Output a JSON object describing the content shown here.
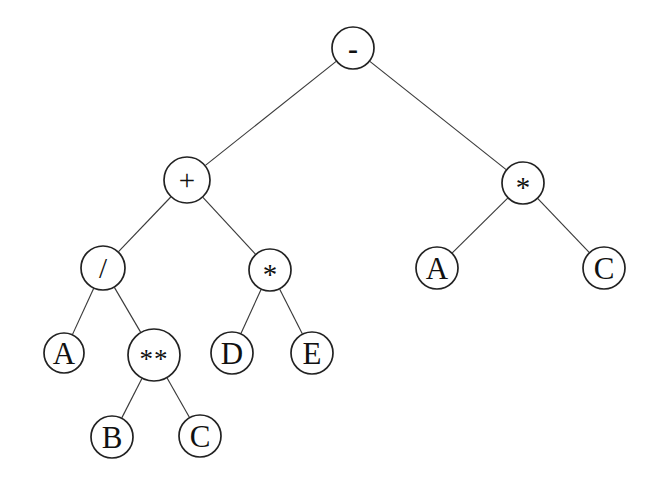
{
  "figure": {
    "kind": "binary-expression-tree",
    "title": "",
    "background_color": "#ffffff",
    "node_fill_color": "#ffffff",
    "node_stroke_color": "#222222",
    "edge_color": "#3a3a3a",
    "label_color": "#111111",
    "expression": "A / B ** C + D * E - A * C"
  },
  "nodes": [
    {
      "id": "n0",
      "label": "-",
      "role": "operator",
      "style": "minus",
      "cx": 353,
      "cy": 48,
      "r": 21
    },
    {
      "id": "n1",
      "label": "+",
      "role": "operator",
      "style": "operator",
      "cx": 187,
      "cy": 180,
      "r": 23
    },
    {
      "id": "n2",
      "label": "*",
      "role": "operator",
      "style": "operator",
      "cx": 523,
      "cy": 183,
      "r": 21
    },
    {
      "id": "n3",
      "label": "/",
      "role": "operator",
      "style": "operator",
      "cx": 103,
      "cy": 268,
      "r": 22
    },
    {
      "id": "n4",
      "label": "*",
      "role": "operator",
      "style": "operator",
      "cx": 270,
      "cy": 270,
      "r": 21
    },
    {
      "id": "n5",
      "label": "A",
      "role": "operand",
      "style": "operand",
      "cx": 437,
      "cy": 268,
      "r": 21
    },
    {
      "id": "n6",
      "label": "C",
      "role": "operand",
      "style": "operand",
      "cx": 604,
      "cy": 268,
      "r": 21
    },
    {
      "id": "n7",
      "label": "A",
      "role": "operand",
      "style": "operand",
      "cx": 64,
      "cy": 353,
      "r": 20
    },
    {
      "id": "n8",
      "label": "**",
      "role": "operator",
      "style": "power",
      "cx": 154,
      "cy": 355,
      "r": 26
    },
    {
      "id": "n9",
      "label": "D",
      "role": "operand",
      "style": "operand",
      "cx": 232,
      "cy": 353,
      "r": 21
    },
    {
      "id": "n10",
      "label": "E",
      "role": "operand",
      "style": "operand",
      "cx": 312,
      "cy": 353,
      "r": 21
    },
    {
      "id": "n11",
      "label": "B",
      "role": "operand",
      "style": "operand",
      "cx": 112,
      "cy": 437,
      "r": 21
    },
    {
      "id": "n12",
      "label": "C",
      "role": "operand",
      "style": "operand",
      "cx": 200,
      "cy": 436,
      "r": 21
    }
  ],
  "edges": [
    {
      "from": "n0",
      "to": "n1"
    },
    {
      "from": "n0",
      "to": "n2"
    },
    {
      "from": "n1",
      "to": "n3"
    },
    {
      "from": "n1",
      "to": "n4"
    },
    {
      "from": "n2",
      "to": "n5"
    },
    {
      "from": "n2",
      "to": "n6"
    },
    {
      "from": "n3",
      "to": "n7"
    },
    {
      "from": "n3",
      "to": "n8"
    },
    {
      "from": "n4",
      "to": "n9"
    },
    {
      "from": "n4",
      "to": "n10"
    },
    {
      "from": "n8",
      "to": "n11"
    },
    {
      "from": "n8",
      "to": "n12"
    }
  ]
}
